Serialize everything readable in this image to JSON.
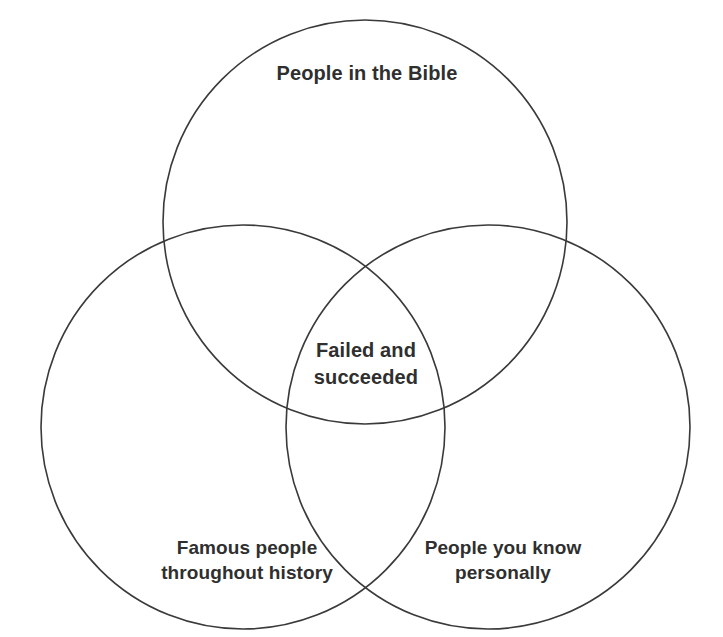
{
  "diagram": {
    "type": "venn",
    "set_count": 3,
    "background_color": "#ffffff",
    "stroke_color": "#3a3a3a",
    "text_color": "#2f2f2f",
    "sets": [
      {
        "id": "bible",
        "label": "People in the Bible",
        "position": "top",
        "center": {
          "x": 365,
          "y": 222
        },
        "radius": 202
      },
      {
        "id": "famous",
        "label": "Famous people\nthroughout history",
        "position": "bottom-left",
        "center": {
          "x": 243,
          "y": 427
        },
        "radius": 202
      },
      {
        "id": "known",
        "label": "People you know\npersonally",
        "position": "bottom-right",
        "center": {
          "x": 488,
          "y": 427
        },
        "radius": 202
      }
    ],
    "intersections": [
      {
        "id": "center",
        "label": "Failed and\nsucceeded",
        "sets": [
          "bible",
          "famous",
          "known"
        ],
        "center": {
          "x": 366,
          "y": 362
        }
      }
    ]
  }
}
